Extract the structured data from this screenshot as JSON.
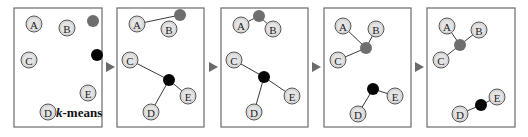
{
  "diagram": {
    "title": "k-means",
    "caption_k": "k",
    "caption_rest": "-means",
    "colors": {
      "node_fill": "#e4e4e4",
      "node_stroke": "#555555",
      "centroid_gray": "#6e6e6e",
      "centroid_black": "#050505",
      "edge": "#3a3a3a",
      "frame": "#6b6b6b",
      "arrow": "#6a6a6a"
    },
    "panels": [
      {
        "step": 1,
        "frame": {
          "x": 14,
          "y": 8,
          "w": 88,
          "h": 119
        },
        "nodes": [
          {
            "label": "A",
            "x": 34,
            "y": 24
          },
          {
            "label": "B",
            "x": 67,
            "y": 28
          },
          {
            "label": "C",
            "x": 29,
            "y": 60
          },
          {
            "label": "E",
            "x": 88,
            "y": 93
          },
          {
            "label": "D",
            "x": 48,
            "y": 112
          }
        ],
        "centroids": [
          {
            "name": "gray",
            "x": 93,
            "y": 21
          },
          {
            "name": "black",
            "x": 97,
            "y": 55
          }
        ],
        "edges": [],
        "caption": true
      },
      {
        "step": 2,
        "frame": {
          "x": 117,
          "y": 8,
          "w": 87,
          "h": 119
        },
        "nodes": [
          {
            "label": "A",
            "x": 137,
            "y": 24
          },
          {
            "label": "B",
            "x": 169,
            "y": 29
          },
          {
            "label": "C",
            "x": 130,
            "y": 60
          },
          {
            "label": "E",
            "x": 188,
            "y": 96
          },
          {
            "label": "D",
            "x": 151,
            "y": 112
          }
        ],
        "centroids": [
          {
            "name": "gray",
            "x": 180,
            "y": 15
          },
          {
            "name": "black",
            "x": 169,
            "y": 80
          }
        ],
        "edges": [
          {
            "from": "A",
            "to": "gray"
          },
          {
            "from": "C",
            "to": "black"
          },
          {
            "from": "D",
            "to": "black"
          },
          {
            "from": "E",
            "to": "black"
          }
        ],
        "caption": false
      },
      {
        "step": 3,
        "frame": {
          "x": 221,
          "y": 8,
          "w": 87,
          "h": 119
        },
        "nodes": [
          {
            "label": "A",
            "x": 241,
            "y": 25
          },
          {
            "label": "B",
            "x": 273,
            "y": 29
          },
          {
            "label": "C",
            "x": 234,
            "y": 60
          },
          {
            "label": "E",
            "x": 292,
            "y": 96
          },
          {
            "label": "D",
            "x": 254,
            "y": 112
          }
        ],
        "centroids": [
          {
            "name": "gray",
            "x": 259,
            "y": 16
          },
          {
            "name": "black",
            "x": 264,
            "y": 77
          }
        ],
        "edges": [
          {
            "from": "A",
            "to": "gray"
          },
          {
            "from": "B",
            "to": "gray"
          },
          {
            "from": "C",
            "to": "black"
          },
          {
            "from": "D",
            "to": "black"
          },
          {
            "from": "E",
            "to": "black"
          }
        ],
        "caption": false
      },
      {
        "step": 4,
        "frame": {
          "x": 324,
          "y": 8,
          "w": 87,
          "h": 119
        },
        "nodes": [
          {
            "label": "A",
            "x": 343,
            "y": 26
          },
          {
            "label": "B",
            "x": 376,
            "y": 29
          },
          {
            "label": "C",
            "x": 338,
            "y": 60
          },
          {
            "label": "E",
            "x": 395,
            "y": 96
          },
          {
            "label": "D",
            "x": 358,
            "y": 114
          }
        ],
        "centroids": [
          {
            "name": "gray",
            "x": 366,
            "y": 48
          },
          {
            "name": "black",
            "x": 373,
            "y": 89
          }
        ],
        "edges": [
          {
            "from": "A",
            "to": "gray"
          },
          {
            "from": "B",
            "to": "gray"
          },
          {
            "from": "C",
            "to": "gray"
          },
          {
            "from": "D",
            "to": "black"
          },
          {
            "from": "E",
            "to": "black"
          }
        ],
        "caption": false
      },
      {
        "step": 5,
        "frame": {
          "x": 427,
          "y": 8,
          "w": 88,
          "h": 119
        },
        "nodes": [
          {
            "label": "A",
            "x": 447,
            "y": 26
          },
          {
            "label": "B",
            "x": 479,
            "y": 30
          },
          {
            "label": "C",
            "x": 441,
            "y": 60
          },
          {
            "label": "E",
            "x": 497,
            "y": 97
          },
          {
            "label": "D",
            "x": 460,
            "y": 114
          }
        ],
        "centroids": [
          {
            "name": "gray",
            "x": 460,
            "y": 45
          },
          {
            "name": "black",
            "x": 481,
            "y": 105
          }
        ],
        "edges": [
          {
            "from": "A",
            "to": "gray"
          },
          {
            "from": "B",
            "to": "gray"
          },
          {
            "from": "C",
            "to": "gray"
          },
          {
            "from": "D",
            "to": "black"
          },
          {
            "from": "E",
            "to": "black"
          }
        ],
        "caption": false
      }
    ],
    "arrows": [
      {
        "x": 110,
        "y": 67
      },
      {
        "x": 213,
        "y": 67
      },
      {
        "x": 316,
        "y": 67
      },
      {
        "x": 419,
        "y": 67
      }
    ],
    "node_radius": 8,
    "centroid_radius": 6,
    "caption_pos": {
      "x": 56,
      "y": 117
    }
  }
}
